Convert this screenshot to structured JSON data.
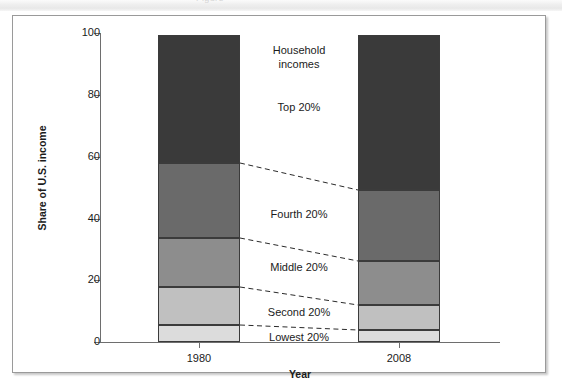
{
  "page": {
    "header_ghost": "Figure  —"
  },
  "chart_data": {
    "type": "bar",
    "subtype": "stacked-bar",
    "title": "",
    "xlabel": "Year",
    "ylabel": "Share of U.S. income",
    "ylim": [
      0,
      100
    ],
    "yticks": [
      0,
      20,
      40,
      60,
      80,
      100
    ],
    "ytick_labels": [
      "0",
      "20",
      "40",
      "60",
      "80",
      "100"
    ],
    "categories": [
      "1980",
      "2008"
    ],
    "grid": false,
    "legend_position": "in-plot-annotations",
    "annotation_title": [
      "Household",
      "incomes"
    ],
    "series": [
      {
        "name": "Lowest 20%",
        "label": "Lowest 20%",
        "values": [
          5.5,
          3.9
        ],
        "color": "#dcdcdc"
      },
      {
        "name": "Second 20%",
        "label": "Second 20%",
        "values": [
          12.3,
          8.1
        ],
        "color": "#c0c0c0"
      },
      {
        "name": "Middle 20%",
        "label": "Middle 20%",
        "values": [
          15.9,
          14.2
        ],
        "color": "#8d8d8d"
      },
      {
        "name": "Fourth 20%",
        "label": "Fourth 20%",
        "values": [
          24.3,
          23.0
        ],
        "color": "#6a6a6a"
      },
      {
        "name": "Top 20%",
        "label": "Top 20%",
        "values": [
          41.2,
          50.2
        ],
        "color": "#3a3a3a"
      }
    ]
  },
  "labels": {
    "household_line1": "Household",
    "household_line2": "incomes",
    "top": "Top 20%",
    "fourth": "Fourth 20%",
    "middle": "Middle 20%",
    "second": "Second 20%",
    "lowest": "Lowest 20%",
    "y_axis_title": "Share of U.S. income",
    "x_axis_title": "Year",
    "x_1980": "1980",
    "x_2008": "2008",
    "y_0": "0",
    "y_20": "20",
    "y_40": "40",
    "y_60": "60",
    "y_80": "80",
    "y_100": "100"
  },
  "colors": {
    "frame": "#9a9a9a",
    "axis": "#6e6e6e",
    "text": "#1b1b1b",
    "segment_border": "#3b3b3b",
    "connector": "#2a2a2a"
  }
}
